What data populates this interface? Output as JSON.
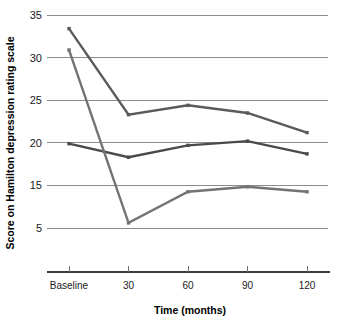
{
  "chart_data": {
    "type": "line",
    "title": "",
    "xlabel": "Time (months)",
    "ylabel": "Score on Hamilton depression rating scale",
    "categories": [
      "Baseline",
      "30",
      "60",
      "90",
      "120"
    ],
    "x_tick_labels": [
      "Baseline",
      "30",
      "60",
      "90",
      "120"
    ],
    "y_tick_labels": [
      "35",
      "30",
      "25",
      "20",
      "15",
      "5"
    ],
    "y_tick_values": [
      35,
      30,
      25,
      20,
      15,
      5
    ],
    "ylim": [
      5,
      35
    ],
    "grid": "horizontal",
    "legend": "none",
    "series": [
      {
        "name": "series-1-upper",
        "color": "#5a5a5a",
        "values": [
          33.4,
          23.3,
          24.4,
          23.5,
          21.2
        ]
      },
      {
        "name": "series-2-middle",
        "color": "#4a4a4a",
        "values": [
          19.9,
          18.3,
          19.7,
          20.2,
          18.7
        ]
      },
      {
        "name": "series-3-lower",
        "color": "#737373",
        "values": [
          30.9,
          6.2,
          13.5,
          14.7,
          13.5
        ]
      }
    ]
  },
  "colors": {
    "gridline": "#8c8c8c",
    "axis": "#3a3a3a",
    "text": "#1a1a1a",
    "background": "#ffffff"
  }
}
